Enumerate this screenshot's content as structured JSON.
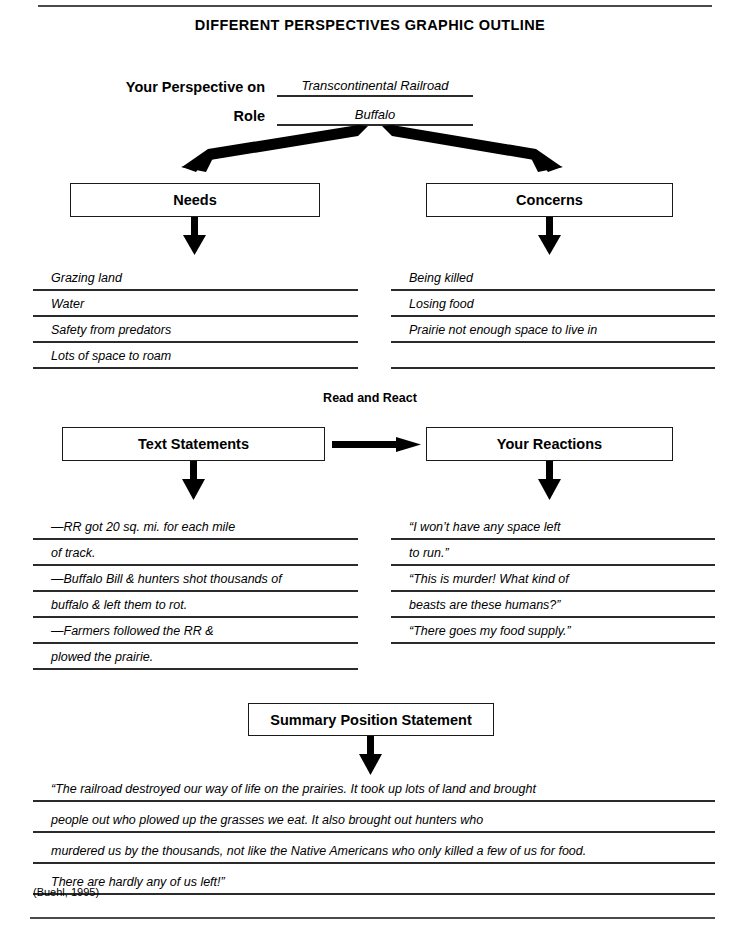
{
  "document": {
    "title": "DIFFERENT PERSPECTIVES GRAPHIC OUTLINE",
    "attribution": "(Buehl, 1995)"
  },
  "header": {
    "perspective_label": "Your Perspective on",
    "perspective_value": "Transcontinental Railroad",
    "role_label": "Role",
    "role_value": "Buffalo"
  },
  "needs": {
    "heading": "Needs",
    "items": [
      "Grazing land",
      "Water",
      "Safety from predators",
      "Lots of space to roam"
    ]
  },
  "concerns": {
    "heading": "Concerns",
    "items": [
      "Being killed",
      "Losing food",
      "Prairie not enough space to live in",
      ""
    ]
  },
  "read_and_react": {
    "section_label": "Read and React",
    "text_statements": {
      "heading": "Text Statements",
      "lines": [
        "—RR got 20 sq. mi. for each mile",
        "of track.",
        "—Buffalo Bill & hunters shot thousands of",
        "buffalo & left them to rot.",
        "—Farmers followed the RR &",
        "plowed the prairie."
      ]
    },
    "your_reactions": {
      "heading": "Your Reactions",
      "lines": [
        "“I won’t have any space left",
        "to run.”",
        "“This is murder! What kind of",
        "beasts are these humans?”",
        "“There goes my food supply.”",
        ""
      ]
    }
  },
  "summary": {
    "heading": "Summary Position Statement",
    "lines": [
      "“The railroad destroyed our way of life on the prairies. It took up lots of land and brought",
      "people out who plowed up the grasses we eat. It also brought out hunters who",
      "murdered us by the thousands, not like the Native Americans who only killed a few of us for food.",
      "There are hardly any of us left!”"
    ]
  },
  "colors": {
    "ink": "#000000",
    "rule": "#4a4a4a",
    "line": "#2b2b2b",
    "paper": "#ffffff"
  }
}
